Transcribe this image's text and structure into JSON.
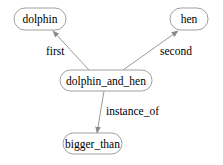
{
  "diagram": {
    "type": "directed-graph",
    "colors": {
      "edge": "#9a9a9a",
      "node_border": "#a0a0a0",
      "text": "#000000",
      "background": "#ffffff"
    },
    "nodes": [
      {
        "id": "dolphin",
        "label": "dolphin"
      },
      {
        "id": "hen",
        "label": "hen"
      },
      {
        "id": "dolphin_and_hen",
        "label": "dolphin_and_hen"
      },
      {
        "id": "bigger_than",
        "label": "bigger_than"
      }
    ],
    "edges": [
      {
        "from": "dolphin_and_hen",
        "to": "dolphin",
        "label": "first"
      },
      {
        "from": "dolphin_and_hen",
        "to": "hen",
        "label": "second"
      },
      {
        "from": "dolphin_and_hen",
        "to": "bigger_than",
        "label": "instance_of"
      }
    ]
  }
}
